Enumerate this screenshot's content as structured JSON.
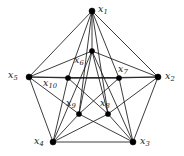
{
  "figure": {
    "type": "undirected-graph-diagram",
    "background_color": "#ffffff",
    "edge_color": "#1a1a1a",
    "vertex_color": "#000000",
    "width": 184,
    "height": 156
  },
  "vertices": [
    {
      "id": "x1",
      "label": "x",
      "subscript": "1",
      "cx": 92,
      "cy": 11,
      "r": 3.0,
      "label_x": 98,
      "label_y": 4,
      "ring": "outer"
    },
    {
      "id": "x2",
      "label": "x",
      "subscript": "2",
      "cx": 158,
      "cy": 77,
      "r": 3.0,
      "label_x": 165,
      "label_y": 71,
      "ring": "outer"
    },
    {
      "id": "x3",
      "label": "x",
      "subscript": "3",
      "cx": 133,
      "cy": 142,
      "r": 3.0,
      "label_x": 140,
      "label_y": 136,
      "ring": "outer"
    },
    {
      "id": "x4",
      "label": "x",
      "subscript": "4",
      "cx": 53,
      "cy": 142,
      "r": 3.0,
      "label_x": 34,
      "label_y": 136,
      "ring": "outer"
    },
    {
      "id": "x5",
      "label": "x",
      "subscript": "5",
      "cx": 29,
      "cy": 77,
      "r": 3.0,
      "label_x": 8,
      "label_y": 70,
      "ring": "outer"
    },
    {
      "id": "x6",
      "label": "x",
      "subscript": "6",
      "cx": 92,
      "cy": 51,
      "r": 2.6,
      "label_x": 74,
      "label_y": 55,
      "ring": "inner"
    },
    {
      "id": "x7",
      "label": "x",
      "subscript": "7",
      "cx": 119,
      "cy": 78,
      "r": 2.6,
      "label_x": 118,
      "label_y": 64,
      "ring": "inner"
    },
    {
      "id": "x8",
      "label": "x",
      "subscript": "8",
      "cx": 108,
      "cy": 114,
      "r": 2.6,
      "label_x": 100,
      "label_y": 98,
      "ring": "inner"
    },
    {
      "id": "x9",
      "label": "x",
      "subscript": "9",
      "cx": 79,
      "cy": 114,
      "r": 2.6,
      "label_x": 66,
      "label_y": 98,
      "ring": "inner"
    },
    {
      "id": "x10",
      "label": "x",
      "subscript": "10",
      "cx": 68,
      "cy": 78,
      "r": 2.6,
      "label_x": 43,
      "label_y": 78,
      "ring": "inner"
    }
  ],
  "edges": [
    {
      "from": "x1",
      "to": "x2"
    },
    {
      "from": "x2",
      "to": "x3"
    },
    {
      "from": "x3",
      "to": "x4"
    },
    {
      "from": "x4",
      "to": "x5"
    },
    {
      "from": "x5",
      "to": "x1"
    },
    {
      "from": "x6",
      "to": "x8"
    },
    {
      "from": "x8",
      "to": "x10"
    },
    {
      "from": "x10",
      "to": "x7"
    },
    {
      "from": "x7",
      "to": "x9"
    },
    {
      "from": "x9",
      "to": "x6"
    },
    {
      "from": "x1",
      "to": "x6"
    },
    {
      "from": "x2",
      "to": "x7"
    },
    {
      "from": "x3",
      "to": "x8"
    },
    {
      "from": "x4",
      "to": "x9"
    },
    {
      "from": "x5",
      "to": "x10"
    },
    {
      "from": "x1",
      "to": "x7"
    },
    {
      "from": "x1",
      "to": "x10"
    },
    {
      "from": "x2",
      "to": "x6"
    },
    {
      "from": "x2",
      "to": "x8"
    },
    {
      "from": "x3",
      "to": "x7"
    },
    {
      "from": "x3",
      "to": "x9"
    },
    {
      "from": "x4",
      "to": "x8"
    },
    {
      "from": "x4",
      "to": "x10"
    },
    {
      "from": "x5",
      "to": "x9"
    },
    {
      "from": "x5",
      "to": "x6"
    },
    {
      "from": "x5",
      "to": "x7"
    },
    {
      "from": "x2",
      "to": "x10"
    },
    {
      "from": "x1",
      "to": "x9"
    },
    {
      "from": "x1",
      "to": "x8"
    },
    {
      "from": "x4",
      "to": "x6"
    },
    {
      "from": "x3",
      "to": "x6"
    }
  ]
}
